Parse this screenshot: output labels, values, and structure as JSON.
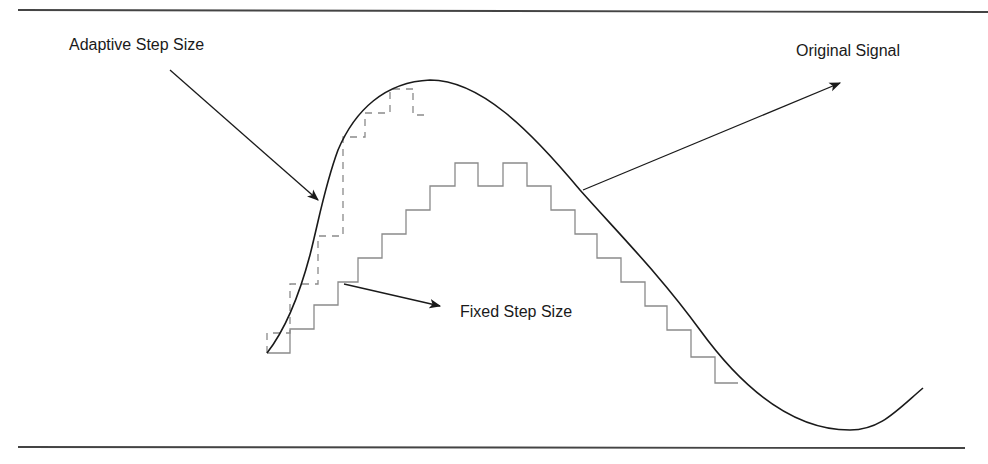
{
  "diagram": {
    "labels": {
      "adaptive": "Adaptive Step Size",
      "original": "Original Signal",
      "fixed": "Fixed Step Size"
    },
    "colors": {
      "signal": "#1a1a1a",
      "fixed_staircase": "#8a8a8a",
      "adaptive_staircase": "#8a8a8a",
      "rule": "#444444",
      "arrow": "#1a1a1a"
    },
    "rules": [
      {
        "name": "top-rule",
        "x1": 18,
        "y1": 10,
        "x2": 988,
        "y2": 12
      },
      {
        "name": "bottom-rule",
        "x1": 18,
        "y1": 447,
        "x2": 965,
        "y2": 448
      }
    ],
    "signal_path": "M267,353 C285,330 298,300 310,255 C320,215 325,185 338,150 C355,110 385,82 430,80 C480,80 530,130 580,190 C620,235 660,275 700,330 C740,385 790,430 850,430 C880,430 895,412 923,388",
    "fixed_staircase": [
      [
        267,
        353
      ],
      [
        290,
        353
      ],
      [
        290,
        329
      ],
      [
        314,
        329
      ],
      [
        314,
        305
      ],
      [
        338,
        305
      ],
      [
        338,
        282
      ],
      [
        358,
        282
      ],
      [
        358,
        258
      ],
      [
        382,
        258
      ],
      [
        382,
        234
      ],
      [
        406,
        234
      ],
      [
        406,
        210
      ],
      [
        430,
        210
      ],
      [
        430,
        186
      ],
      [
        455,
        186
      ],
      [
        455,
        163
      ],
      [
        478,
        163
      ],
      [
        478,
        186
      ],
      [
        503,
        186
      ],
      [
        503,
        163
      ],
      [
        527,
        163
      ],
      [
        527,
        186
      ],
      [
        551,
        186
      ],
      [
        551,
        210
      ],
      [
        575,
        210
      ],
      [
        575,
        234
      ],
      [
        597,
        234
      ],
      [
        597,
        258
      ],
      [
        621,
        258
      ],
      [
        621,
        282
      ],
      [
        645,
        282
      ],
      [
        645,
        306
      ],
      [
        667,
        306
      ],
      [
        667,
        330
      ],
      [
        691,
        330
      ],
      [
        691,
        357
      ],
      [
        715,
        357
      ],
      [
        715,
        383
      ],
      [
        738,
        383
      ]
    ],
    "adaptive_staircase": [
      [
        267,
        353
      ],
      [
        267,
        333
      ],
      [
        290,
        333
      ],
      [
        290,
        284
      ],
      [
        318,
        284
      ],
      [
        318,
        236
      ],
      [
        343,
        236
      ],
      [
        343,
        137
      ],
      [
        365,
        137
      ],
      [
        365,
        113
      ],
      [
        390,
        113
      ],
      [
        390,
        89
      ],
      [
        413,
        89
      ],
      [
        413,
        88
      ],
      [
        413,
        115
      ],
      [
        430,
        115
      ]
    ],
    "arrows": [
      {
        "name": "adaptive-arrow",
        "x1": 170,
        "y1": 70,
        "x2": 318,
        "y2": 200
      },
      {
        "name": "original-arrow",
        "x1": 583,
        "y1": 190,
        "x2": 840,
        "y2": 83
      },
      {
        "name": "fixed-arrow",
        "x1": 344,
        "y1": 284,
        "x2": 440,
        "y2": 306
      }
    ]
  }
}
